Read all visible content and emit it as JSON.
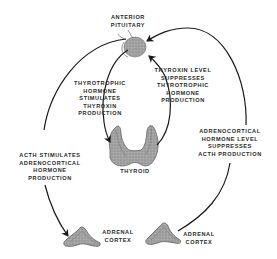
{
  "diagram": {
    "nodes": {
      "pituitary": {
        "label_lines": [
          "ANTERIOR",
          "PITUITARY"
        ]
      },
      "thyroid": {
        "label_lines": [
          "THYROID"
        ]
      },
      "adrenal_left": {
        "label_lines": [
          "ADRENAL",
          "CORTEX"
        ]
      },
      "adrenal_right": {
        "label_lines": [
          "ADRENAL",
          "CORTEX"
        ]
      }
    },
    "edges": {
      "tsh_stimulates": {
        "label_lines": [
          "THYROTROPHIC",
          "HORMONE",
          "STIMULATES",
          "THYROXIN",
          "PRODUCTION"
        ],
        "from": "pituitary",
        "to": "thyroid"
      },
      "thyroxin_suppresses": {
        "label_lines": [
          "THYROXIN LEVEL",
          "SUPPRESSES",
          "THYROTROPHIC",
          "HORMONE",
          "PRODUCTION"
        ],
        "from": "thyroid",
        "to": "pituitary"
      },
      "acth_stimulates": {
        "label_lines": [
          "ACTH STIMULATES",
          "ADRENOCORTICAL",
          "HORMONE",
          "PRODUCTION"
        ],
        "from": "pituitary",
        "to": "adrenal_left"
      },
      "adrenocortical_suppresses": {
        "label_lines": [
          "ADRENOCORTICAL",
          "HORMONE LEVEL",
          "SUPPRESSES",
          "ACTH PRODUCTION"
        ],
        "from": "adrenal_right",
        "to": "pituitary"
      }
    },
    "colors": {
      "line": "#1a1a1a",
      "organ_fill": "#9a9a9a",
      "organ_stroke": "#5a5a5a",
      "text": "#2a2a2a",
      "background": "#ffffff"
    }
  }
}
